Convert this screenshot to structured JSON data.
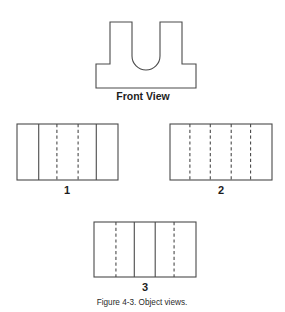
{
  "figure": {
    "caption": "Figure 4-3. Object views.",
    "front_view_label": "Front View"
  },
  "chart_data": {
    "type": "diagram",
    "title": "Figure 4-3. Object views.",
    "line_legend": {
      "solid": "visible edge",
      "dashed": "hidden edge"
    },
    "colors": {
      "line": "#4a4a4a",
      "background": "#ffffff",
      "text": "#1d1d1d"
    },
    "front_view": {
      "label": "Front View",
      "shape": "T-shaped block with central U-shaped slot",
      "base": {
        "x": 96,
        "y": 64,
        "width": 100,
        "height": 24
      },
      "left_prong": {
        "x": 110,
        "y": 22,
        "width": 22,
        "height": 42
      },
      "right_prong": {
        "x": 160,
        "y": 22,
        "width": 22,
        "height": 42
      },
      "slot": {
        "x": 132,
        "y": 22,
        "width": 28,
        "depth": 34,
        "bottom": "semicircular"
      }
    },
    "options": [
      {
        "number": "1",
        "rect": {
          "x": 17,
          "y": 124,
          "width": 101,
          "height": 56
        },
        "internal_lines": [
          {
            "offset_ratio": 0.215,
            "style": "solid"
          },
          {
            "offset_ratio": 0.395,
            "style": "dashed"
          },
          {
            "offset_ratio": 0.605,
            "style": "dashed"
          },
          {
            "offset_ratio": 0.785,
            "style": "solid"
          }
        ]
      },
      {
        "number": "2",
        "rect": {
          "x": 170,
          "y": 124,
          "width": 102,
          "height": 56
        },
        "internal_lines": [
          {
            "offset_ratio": 0.195,
            "style": "dashed"
          },
          {
            "offset_ratio": 0.395,
            "style": "dashed"
          },
          {
            "offset_ratio": 0.6,
            "style": "dashed"
          },
          {
            "offset_ratio": 0.79,
            "style": "dashed"
          }
        ]
      },
      {
        "number": "3",
        "rect": {
          "x": 94,
          "y": 222,
          "width": 102,
          "height": 55
        },
        "internal_lines": [
          {
            "offset_ratio": 0.215,
            "style": "dashed"
          },
          {
            "offset_ratio": 0.395,
            "style": "solid"
          },
          {
            "offset_ratio": 0.6,
            "style": "solid"
          },
          {
            "offset_ratio": 0.785,
            "style": "dashed"
          }
        ]
      }
    ],
    "label_positions": {
      "front_view": {
        "x": 143,
        "y": 100
      },
      "option_1": {
        "x": 67,
        "y": 194
      },
      "option_2": {
        "x": 221,
        "y": 194
      },
      "option_3": {
        "x": 145,
        "y": 291
      },
      "caption": {
        "x": 142,
        "y": 305
      }
    }
  }
}
